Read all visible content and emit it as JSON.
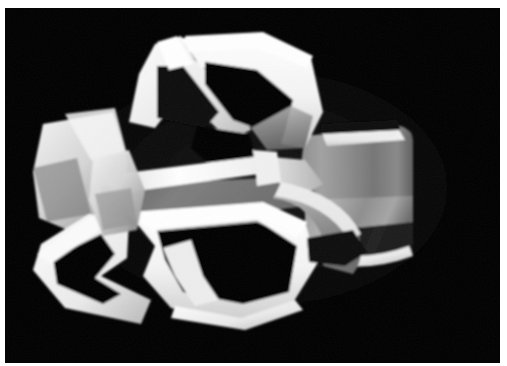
{
  "image": {
    "kind": "photograph",
    "subject": "abstract white geometric sculpture",
    "background_color": "#000000",
    "border_color": "#ffffff",
    "width": 507,
    "height": 366,
    "alt_text": "Photograph of an abstract white sculpture with angular cut-out forms on a black background",
    "caption": ""
  },
  "photo": {
    "plate": {
      "x": 5,
      "y": 8,
      "width": 495,
      "height": 355
    },
    "palette": {
      "black": "#000000",
      "near_black": "#050505",
      "shadow_gray": "#3a3a3a",
      "mid_gray": "#6e6e6e",
      "light_gray": "#9a9a9a",
      "pale_gray": "#c8c8c8",
      "off_white": "#e8e8e8",
      "white": "#ffffff",
      "border_white": "#fdfdfd"
    },
    "subject_bounds": {
      "x": 110,
      "y": 80,
      "width": 300,
      "height": 220
    },
    "lighting": "key light from upper left, strong specular highlights on edges"
  },
  "parts": {
    "upper_left_blade": "upper-left angular blade",
    "upper_right_blade": "upper-right angular blade",
    "lower_left_blade": "lower-left angular blade",
    "lower_right_blade": "lower-right angular blade",
    "cylinder_body": "curved cylindrical body at right",
    "central_seam": "central horizontal seam ridge",
    "left_wing": "left side triangular wing"
  }
}
